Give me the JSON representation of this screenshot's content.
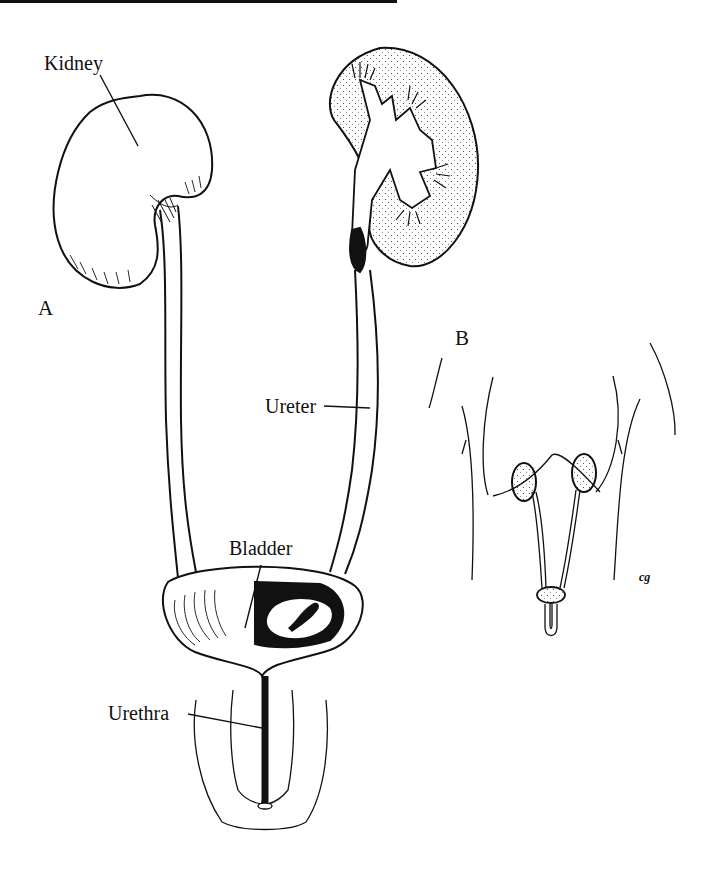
{
  "figure": {
    "panels": [
      {
        "id": "A",
        "label": "A"
      },
      {
        "id": "B",
        "label": "B"
      }
    ],
    "labels": {
      "kidney": "Kidney",
      "ureter": "Ureter",
      "bladder": "Bladder",
      "urethra": "Urethra"
    },
    "signature": "cg",
    "colors": {
      "ink": "#111111",
      "paper": "#ffffff"
    }
  }
}
